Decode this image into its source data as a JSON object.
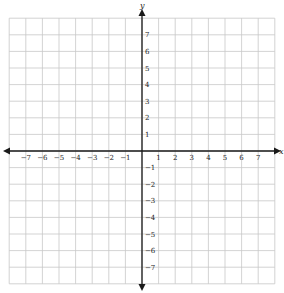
{
  "diagram": {
    "type": "coordinate-plane",
    "x_axis": {
      "label": "x",
      "min": -8,
      "max": 8,
      "tick_labels": [
        "−7",
        "−6",
        "−5",
        "−4",
        "−3",
        "−2",
        "−1",
        "1",
        "2",
        "3",
        "4",
        "5",
        "6",
        "7"
      ],
      "tick_values": [
        -7,
        -6,
        -5,
        -4,
        -3,
        -2,
        -1,
        1,
        2,
        3,
        4,
        5,
        6,
        7
      ]
    },
    "y_axis": {
      "label": "y",
      "min": -8,
      "max": 8,
      "tick_labels": [
        "7",
        "6",
        "5",
        "4",
        "3",
        "2",
        "1",
        "−1",
        "−2",
        "−3",
        "−4",
        "−5",
        "−6",
        "−7"
      ],
      "tick_values": [
        7,
        6,
        5,
        4,
        3,
        2,
        1,
        -1,
        -2,
        -3,
        -4,
        -5,
        -6,
        -7
      ]
    },
    "grid": {
      "cells_x": 16,
      "cells_y": 16,
      "color": "#c8c8c8"
    },
    "axis_color": "#1a1a1a"
  }
}
